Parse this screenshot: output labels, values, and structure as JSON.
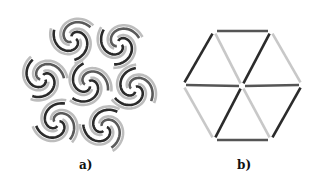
{
  "figure": {
    "panels": [
      {
        "id": "a",
        "caption": "a)",
        "description": "Hexagonal cluster of seven triple-arm swirl motifs with alternating dark and light grey arcs",
        "colors": {
          "dark": "#2b2b2b",
          "mid": "#5a5a5a",
          "light": "#bdbdbd"
        },
        "swirl_centers": [
          [
            73,
            39
          ],
          [
            119,
            44
          ],
          [
            43,
            78
          ],
          [
            88,
            84
          ],
          [
            134,
            89
          ],
          [
            57,
            123
          ],
          [
            104,
            128
          ]
        ]
      },
      {
        "id": "b",
        "caption": "b)",
        "description": "Hexagon divided into six triangles; edges drawn in dark or light grey",
        "colors": {
          "dark": "#2b2b2b",
          "mid": "#555555",
          "light": "#c8c8c8"
        },
        "vertices": {
          "top_left": [
            54,
            31
          ],
          "top_right": [
            111,
            31
          ],
          "right": [
            142,
            85
          ],
          "bottom_right": [
            111,
            140
          ],
          "bottom_left": [
            54,
            140
          ],
          "left": [
            23,
            85
          ],
          "center": [
            82,
            86
          ]
        }
      }
    ]
  }
}
